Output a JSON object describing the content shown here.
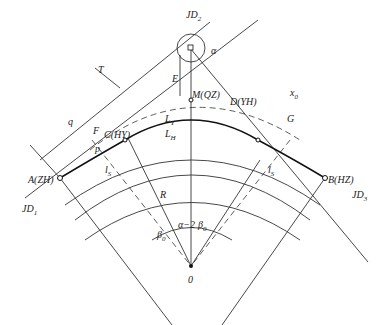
{
  "diagram": {
    "points": {
      "jd1": "JD",
      "jd1_sub": "1",
      "jd2": "JD",
      "jd2_sub": "2",
      "jd3": "JD",
      "jd3_sub": "3",
      "a": "A(ZH)",
      "b": "B(HZ)",
      "c": "C(HY)",
      "d": "D(YH)",
      "m": "M(QZ)",
      "center": "0",
      "f": "F",
      "g": "G"
    },
    "dimensions": {
      "tangent": "T",
      "q": "q",
      "x0": "x",
      "x0_sub": "0",
      "e": "E",
      "p": "p",
      "ly": "L",
      "ly_sub": "Y",
      "lh": "L",
      "lh_sub": "H",
      "ls_left": "l",
      "ls_left_sub": "S",
      "ls_right": "l",
      "ls_right_sub": "S",
      "radius": "R"
    },
    "angles": {
      "alpha": "α",
      "center_angle": "α−2",
      "beta0_left": "β",
      "beta0_right": "β",
      "beta0_sub": "0"
    }
  }
}
